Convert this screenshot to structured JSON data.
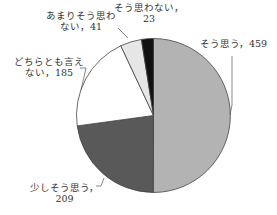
{
  "chart_data": {
    "type": "pie",
    "title": "",
    "start_angle_deg": 0,
    "direction": "clockwise",
    "categories": [
      "そう思う",
      "少しそう思う",
      "どちらとも言えない",
      "あまりそう思わない",
      "そう思わない"
    ],
    "values": [
      459,
      209,
      185,
      41,
      23
    ],
    "colors": [
      "#b3b3b3",
      "#595959",
      "#ffffff",
      "#e6e6e6",
      "#111111"
    ],
    "labels": [
      {
        "line1": "そう思う，459",
        "line2": ""
      },
      {
        "line1": "少しそう思う，",
        "line2": "209"
      },
      {
        "line1": "どちらとも言え",
        "line2": "ない，185"
      },
      {
        "line1": "あまりそう思わ",
        "line2": "ない，41"
      },
      {
        "line1": "そう思わない，",
        "line2": "23"
      }
    ],
    "legend": "none",
    "data_labels": "category, value"
  }
}
